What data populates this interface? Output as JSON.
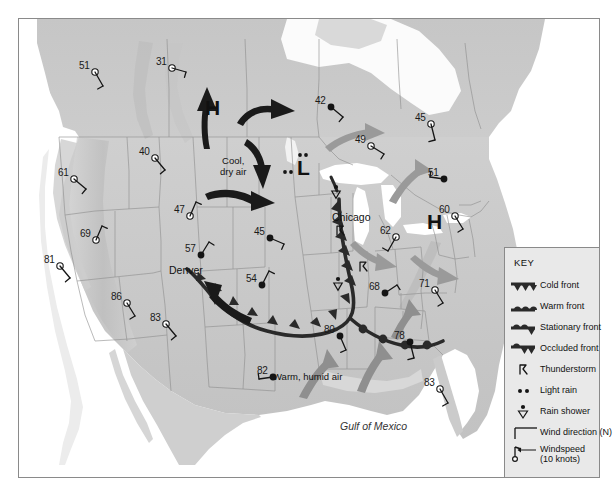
{
  "map": {
    "ocean_label": "Gulf of Mexico",
    "pressure_centers": [
      {
        "letter": "H",
        "name": "high-pressure-center-northwest",
        "x": 212,
        "y": 108
      },
      {
        "letter": "L",
        "name": "low-pressure-center-midwest",
        "x": 304,
        "y": 168
      },
      {
        "letter": "H",
        "name": "high-pressure-center-northeast",
        "x": 434,
        "y": 222
      }
    ],
    "air_mass_labels": [
      {
        "name": "cool-dry-air-label",
        "line1": "Cool,",
        "line2": "dry air",
        "x": 242,
        "y": 156
      },
      {
        "name": "warm-humid-air-label",
        "line1": "Warm, humid air",
        "line2": "",
        "x": 295,
        "y": 372
      }
    ],
    "cities": [
      {
        "name": "chicago",
        "label": "Chicago",
        "x": 348,
        "y": 212
      },
      {
        "name": "denver",
        "label": "Denver",
        "x": 185,
        "y": 265
      }
    ],
    "stations": [
      {
        "id": "station-51-nw",
        "temp": "51",
        "x": 95,
        "y": 72,
        "filled": false
      },
      {
        "id": "station-31-n",
        "temp": "31",
        "x": 172,
        "y": 68,
        "filled": false
      },
      {
        "id": "station-42-n",
        "temp": "42",
        "x": 331,
        "y": 107,
        "filled": true
      },
      {
        "id": "station-45-ne",
        "temp": "45",
        "x": 431,
        "y": 124,
        "filled": false
      },
      {
        "id": "station-40-nw",
        "temp": "40",
        "x": 155,
        "y": 158,
        "filled": false
      },
      {
        "id": "station-49-n",
        "temp": "49",
        "x": 371,
        "y": 146,
        "filled": false
      },
      {
        "id": "station-51-ne",
        "temp": "51",
        "x": 444,
        "y": 179,
        "filled": true
      },
      {
        "id": "station-61-w",
        "temp": "61",
        "x": 74,
        "y": 179,
        "filled": false
      },
      {
        "id": "station-47-w",
        "temp": "47",
        "x": 190,
        "y": 216,
        "filled": false
      },
      {
        "id": "station-60-ne",
        "temp": "60",
        "x": 455,
        "y": 216,
        "filled": false
      },
      {
        "id": "station-62-e",
        "temp": "62",
        "x": 396,
        "y": 237,
        "filled": false
      },
      {
        "id": "station-45-c",
        "temp": "45",
        "x": 270,
        "y": 238,
        "filled": true
      },
      {
        "id": "station-69-w",
        "temp": "69",
        "x": 96,
        "y": 240,
        "filled": false
      },
      {
        "id": "station-57-denver",
        "temp": "57",
        "x": 201,
        "y": 255,
        "filled": true
      },
      {
        "id": "station-81-w",
        "temp": "81",
        "x": 60,
        "y": 266,
        "filled": false
      },
      {
        "id": "station-54-c",
        "temp": "54",
        "x": 262,
        "y": 285,
        "filled": true
      },
      {
        "id": "station-71-e",
        "temp": "71",
        "x": 435,
        "y": 290,
        "filled": false
      },
      {
        "id": "station-68-e",
        "temp": "68",
        "x": 385,
        "y": 293,
        "filled": true
      },
      {
        "id": "station-86-sw",
        "temp": "86",
        "x": 127,
        "y": 303,
        "filled": false
      },
      {
        "id": "station-83-sw",
        "temp": "83",
        "x": 166,
        "y": 324,
        "filled": false
      },
      {
        "id": "station-78-se",
        "temp": "78",
        "x": 410,
        "y": 342,
        "filled": true
      },
      {
        "id": "station-80-s",
        "temp": "80",
        "x": 340,
        "y": 336,
        "filled": true
      },
      {
        "id": "station-82-s",
        "temp": "82",
        "x": 273,
        "y": 377,
        "filled": true
      },
      {
        "id": "station-83-fl",
        "temp": "83",
        "x": 440,
        "y": 389,
        "filled": false
      }
    ],
    "thunderstorms": [
      {
        "id": "thunderstorm-chicago",
        "x": 341,
        "y": 231
      },
      {
        "id": "thunderstorm-south",
        "x": 364,
        "y": 267
      }
    ],
    "light_rain": [
      {
        "id": "light-rain-west",
        "x": 288,
        "y": 172
      },
      {
        "id": "light-rain-north",
        "x": 303,
        "y": 155
      }
    ],
    "rain_showers": [
      {
        "id": "rain-shower-north",
        "x": 336,
        "y": 193
      },
      {
        "id": "rain-shower-south",
        "x": 338,
        "y": 285
      }
    ]
  },
  "legend": {
    "title": "KEY",
    "items": [
      {
        "symbol": "cold-front",
        "label": "Cold front"
      },
      {
        "symbol": "warm-front",
        "label": "Warm front"
      },
      {
        "symbol": "stationary-front",
        "label": "Stationary front"
      },
      {
        "symbol": "occluded-front",
        "label": "Occluded front"
      },
      {
        "symbol": "thunderstorm",
        "label": "Thunderstorm"
      },
      {
        "symbol": "light-rain",
        "label": "Light rain"
      },
      {
        "symbol": "rain-shower",
        "label": "Rain shower"
      },
      {
        "symbol": "wind-direction",
        "label": "Wind direction (N)"
      },
      {
        "symbol": "windspeed",
        "label": "Windspeed",
        "label2": "(10 knots)"
      }
    ]
  },
  "colors": {
    "land": "#c9c9c9",
    "land_light": "#dcdcdc",
    "lake": "#ffffff",
    "front_line": "#262626",
    "arrow_dark": "#1a1a1a",
    "arrow_gray": "#8f8f8f",
    "legend_bg": "#e9e9e9",
    "border": "#8a8a8a"
  }
}
